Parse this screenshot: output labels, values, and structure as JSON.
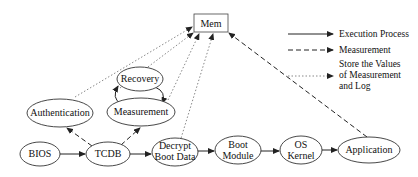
{
  "nodes": {
    "mem": "Mem",
    "recovery": "Recovery",
    "authentication": "Authentication",
    "measurement": "Measurement",
    "bios": "BIOS",
    "tcdb": "TCDB",
    "decrypt_line1": "Decrypt",
    "decrypt_line2": "Boot Data",
    "boot_line1": "Boot",
    "boot_line2": "Module",
    "os_line1": "OS",
    "os_line2": "Kernel",
    "application": "Application"
  },
  "legend": {
    "execution": "Execution Process",
    "measurement": "Measurement",
    "store_line1": "Store the Values",
    "store_line2": "of Measurement",
    "store_line3": "and Log"
  },
  "colors": {
    "stroke": "#222222",
    "dotted": "#888888"
  }
}
